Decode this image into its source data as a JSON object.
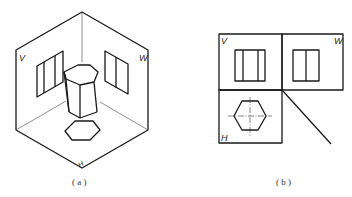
{
  "figure_a": {
    "caption": "( a )",
    "plane_labels": {
      "v": "V",
      "w": "W",
      "h": "H"
    },
    "description": "Isometric view of hexagonal prism placed in the three projection planes corner"
  },
  "figure_b": {
    "caption": "( b )",
    "plane_labels": {
      "v": "V",
      "w": "W",
      "h": "H"
    },
    "description": "Orthographic three-view projection of a hexagonal prism"
  },
  "colors": {
    "line": "#1a1a1a",
    "background": "#ffffff"
  }
}
